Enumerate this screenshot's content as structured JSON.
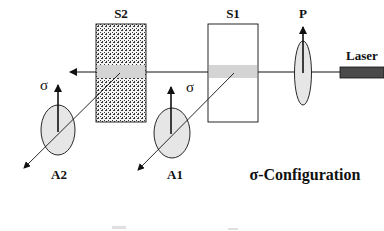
{
  "diagram": {
    "title": "σ-Configuration",
    "components": {
      "laser": {
        "label": "Laser",
        "color": "#4a4a4a"
      },
      "polarizer": {
        "label": "P"
      },
      "sample1": {
        "label": "S1"
      },
      "sample2": {
        "label": "S2"
      },
      "analyzer1": {
        "label": "A1",
        "polarization": "σ"
      },
      "analyzer2": {
        "label": "A2",
        "polarization": "σ"
      }
    },
    "colors": {
      "beam_band": "#d4d4d4",
      "ellipse_fill": "#e6e6e6",
      "stroke": "#111111",
      "texture": "#222222"
    },
    "bottom_partial_text": ""
  }
}
